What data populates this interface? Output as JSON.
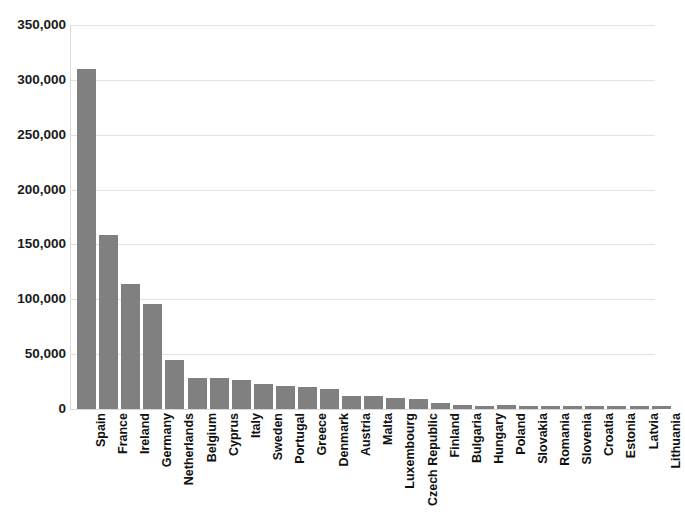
{
  "chart_data": {
    "type": "bar",
    "title": "",
    "xlabel": "",
    "ylabel": "",
    "ylim": [
      0,
      350000
    ],
    "ytick_labels": [
      "350,000",
      "300,000",
      "250,000",
      "200,000",
      "150,000",
      "100,000",
      "50,000",
      "0"
    ],
    "ytick_values": [
      350000,
      300000,
      250000,
      200000,
      150000,
      100000,
      50000,
      0
    ],
    "grid": true,
    "legend": "none",
    "bar_color": "#808080",
    "categories": [
      "Spain",
      "France",
      "Ireland",
      "Germany",
      "Netherlands",
      "Belgium",
      "Cyprus",
      "Italy",
      "Sweden",
      "Portugal",
      "Greece",
      "Denmark",
      "Austria",
      "Malta",
      "Luxembourg",
      "Czech Republic",
      "Finland",
      "Bulgaria",
      "Hungary",
      "Poland",
      "Slovakia",
      "Romania",
      "Slovenia",
      "Croatia",
      "Estonia",
      "Latvia",
      "Lithuania"
    ],
    "values": [
      310000,
      159000,
      114000,
      96000,
      44500,
      28500,
      28000,
      26500,
      23000,
      21000,
      20500,
      18000,
      12000,
      11500,
      10000,
      9500,
      5500,
      3500,
      3000,
      3500,
      3200,
      3000,
      3000,
      2800,
      2800,
      2600,
      2500
    ]
  }
}
